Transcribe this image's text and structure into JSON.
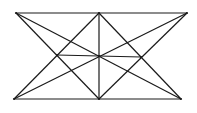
{
  "diagram": {
    "stroke_color": "#1a1a1a",
    "background": "#ffffff",
    "points": {
      "TL": [
        16,
        13
      ],
      "TM": [
        99,
        13
      ],
      "TR": [
        187,
        13
      ],
      "BL": [
        14,
        99
      ],
      "BM": [
        99,
        99
      ],
      "BR": [
        181,
        99
      ],
      "L": [
        57,
        55
      ],
      "C": [
        99,
        56
      ],
      "R": [
        141,
        57
      ]
    },
    "segments": [
      [
        "TL",
        "TR"
      ],
      [
        "BL",
        "BR"
      ],
      [
        "TM",
        "BM"
      ],
      [
        "TL",
        "BR"
      ],
      [
        "TR",
        "BL"
      ],
      [
        "TM",
        "BL"
      ],
      [
        "TM",
        "BR"
      ],
      [
        "BM",
        "TL"
      ],
      [
        "BM",
        "TR"
      ],
      [
        "L",
        "R"
      ]
    ]
  }
}
